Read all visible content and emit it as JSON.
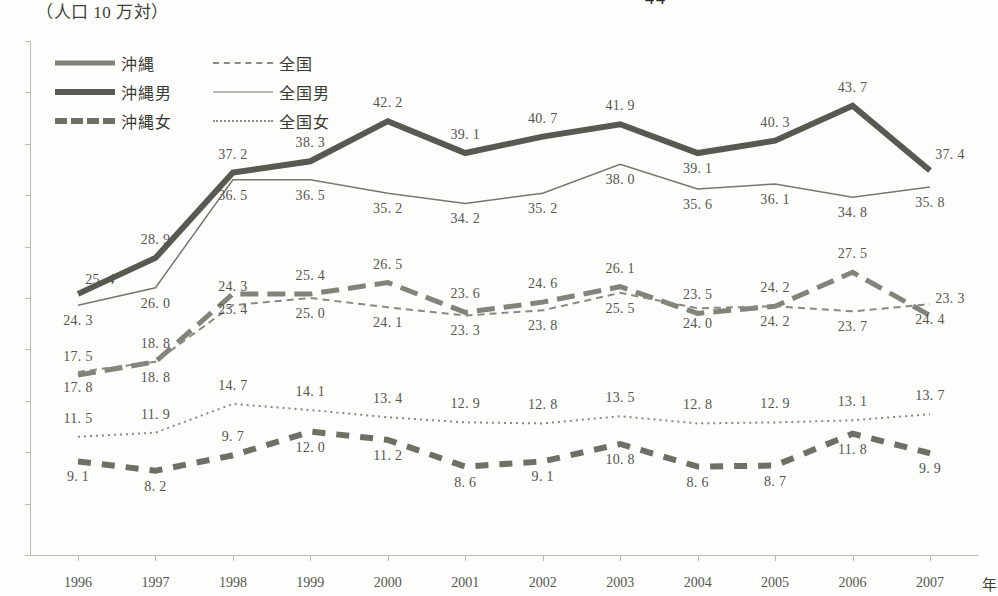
{
  "page_number": "44",
  "unit_note": "（人口 10 万対）",
  "legend": [
    {
      "key": "okinawa",
      "label": "沖縄",
      "style": "sw-oki"
    },
    {
      "key": "all_japan",
      "label": "全国",
      "style": "sw-all"
    },
    {
      "key": "okinawa_male",
      "label": "沖縄男",
      "style": "sw-okiM"
    },
    {
      "key": "all_japan_male",
      "label": "全国男",
      "style": "sw-allM"
    },
    {
      "key": "okinawa_female",
      "label": "沖縄女",
      "style": "sw-okiF"
    },
    {
      "key": "all_japan_female",
      "label": "全国女",
      "style": "sw-allF"
    }
  ],
  "chart_data": {
    "type": "line",
    "title": "",
    "xlabel": "年",
    "ylabel": "（人口 10 万対）",
    "ylim": [
      0,
      50
    ],
    "ytick_step": 5,
    "ytick_labels": [
      "0",
      "0",
      "0",
      "0",
      "0",
      "0",
      "0",
      "0",
      "0",
      "0",
      "0"
    ],
    "grid": false,
    "legend_position": "top-left",
    "categories": [
      "1996",
      "1997",
      "1998",
      "1999",
      "2000",
      "2001",
      "2002",
      "2003",
      "2004",
      "2005",
      "2006",
      "2007"
    ],
    "series": [
      {
        "name": "沖縄男",
        "key": "okinawa_male",
        "color": "#595951",
        "width": 6,
        "dash": "none",
        "values": [
          25.4,
          28.9,
          37.2,
          38.3,
          42.2,
          39.1,
          40.7,
          41.9,
          39.1,
          40.3,
          43.7,
          37.4
        ],
        "label_pos": [
          "below-left",
          "above",
          "above",
          "above",
          "above",
          "above",
          "above",
          "above",
          "below",
          "above",
          "above",
          "right"
        ]
      },
      {
        "name": "全国男",
        "key": "all_japan_male",
        "color": "#77776e",
        "width": 1.5,
        "dash": "none",
        "values": [
          24.3,
          26.0,
          36.5,
          36.5,
          35.2,
          34.2,
          35.2,
          38.0,
          35.6,
          36.1,
          34.8,
          35.8
        ],
        "label_pos": [
          "below",
          "below",
          "below",
          "below",
          "below",
          "below",
          "below",
          "below",
          "below",
          "below",
          "below",
          "below"
        ]
      },
      {
        "name": "沖縄",
        "key": "okinawa",
        "color": "#83837a",
        "width": 5,
        "dash": "18,9",
        "values": [
          17.5,
          18.8,
          25.4,
          25.4,
          26.5,
          23.6,
          24.6,
          26.1,
          23.5,
          24.2,
          27.5,
          23.3
        ],
        "label_pos": [
          "above",
          "above",
          "below",
          "above",
          "above",
          "above",
          "above",
          "above",
          "above",
          "above",
          "above",
          "right"
        ]
      },
      {
        "name": "全国",
        "key": "all_japan",
        "color": "#8a8a80",
        "width": 2,
        "dash": "7,5",
        "values": [
          17.8,
          18.8,
          24.3,
          25.0,
          24.1,
          23.3,
          23.8,
          25.5,
          24.0,
          24.2,
          23.7,
          24.4
        ],
        "label_pos": [
          "below",
          "below",
          "above",
          "below",
          "below",
          "below",
          "below",
          "below",
          "below",
          "below",
          "below",
          "below"
        ]
      },
      {
        "name": "全国女",
        "key": "all_japan_female",
        "color": "#8a8a80",
        "width": 2,
        "dash": "2,4",
        "values": [
          11.5,
          11.9,
          14.7,
          14.1,
          13.4,
          12.9,
          12.8,
          13.5,
          12.8,
          12.9,
          13.1,
          13.7
        ],
        "label_pos": [
          "above",
          "above",
          "above",
          "above",
          "above",
          "above",
          "above",
          "above",
          "above",
          "above",
          "above",
          "above"
        ]
      },
      {
        "name": "沖縄女",
        "key": "okinawa_female",
        "color": "#6f6f66",
        "width": 6,
        "dash": "13,11",
        "values": [
          9.1,
          8.2,
          9.7,
          12.0,
          11.2,
          8.6,
          9.1,
          10.8,
          8.6,
          8.7,
          11.8,
          9.9
        ],
        "label_pos": [
          "below",
          "below",
          "above",
          "below",
          "below",
          "below",
          "below",
          "below",
          "below",
          "below",
          "below",
          "below"
        ]
      }
    ]
  }
}
